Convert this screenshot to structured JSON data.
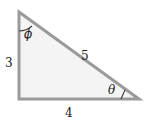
{
  "figure": {
    "type": "right-triangle-diagram",
    "colors": {
      "background": "#ffffff",
      "fill": "#f4f4f4",
      "stroke": "#9a9a9a",
      "text": "#1a1a1a"
    },
    "sides": {
      "vertical_leg": "3",
      "horizontal_leg": "4",
      "hypotenuse": "5"
    },
    "angles": {
      "top_vertex": "ϕ",
      "bottom_right_vertex": "θ"
    },
    "geometry": {
      "top_left": "19,12",
      "bottom_left": "19,99",
      "bottom_right": "139,99",
      "stroke_width": "3"
    }
  }
}
